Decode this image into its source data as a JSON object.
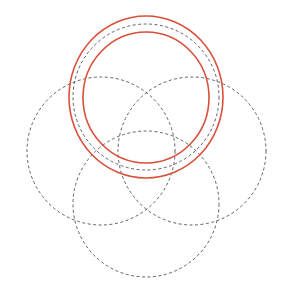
{
  "diagram": {
    "colors": {
      "dashed": "#4a4f5c",
      "highlight": "#d9503a",
      "background": "#ffffff"
    },
    "dashed_circles": [
      {
        "name": "top",
        "cx": 146,
        "cy": 97,
        "r": 73
      },
      {
        "name": "left",
        "cx": 101,
        "cy": 151,
        "r": 74
      },
      {
        "name": "right",
        "cx": 192,
        "cy": 151,
        "r": 74
      },
      {
        "name": "bottom",
        "cx": 146,
        "cy": 204,
        "r": 73
      }
    ],
    "highlight_rings": [
      {
        "name": "outer",
        "cx": 146,
        "cy": 97,
        "rx": 77,
        "ry": 81
      },
      {
        "name": "inner",
        "cx": 146,
        "cy": 97.5,
        "rx": 63,
        "ry": 65.5
      }
    ]
  }
}
